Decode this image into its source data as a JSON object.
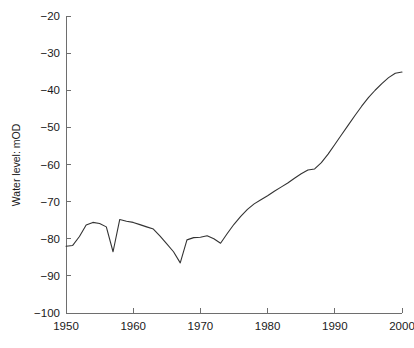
{
  "chart_data": {
    "type": "line",
    "title": "",
    "subtitle": "",
    "xlabel": "",
    "ylabel": "Water level: mOD",
    "xlim": [
      1950,
      2000
    ],
    "ylim": [
      -100,
      -20
    ],
    "grid": false,
    "legend": null,
    "legend_position": "none",
    "x_ticks": [
      1950,
      1960,
      1970,
      1980,
      1990,
      2000
    ],
    "x_tick_labels": [
      "1950",
      "1960",
      "1970",
      "1980",
      "1990",
      "2000"
    ],
    "y_ticks": [
      -100,
      -90,
      -80,
      -70,
      -60,
      -50,
      -40,
      -30,
      -20
    ],
    "y_tick_labels": [
      "−100",
      "−90",
      "−80",
      "−70",
      "−60",
      "−50",
      "−40",
      "−30",
      "−20"
    ],
    "series": [
      {
        "name": "Water level",
        "color": "#333333",
        "x": [
          1950,
          1951,
          1952,
          1953,
          1954,
          1955,
          1956,
          1957,
          1958,
          1959,
          1960,
          1961,
          1962,
          1963,
          1964,
          1965,
          1966,
          1967,
          1968,
          1969,
          1970,
          1971,
          1972,
          1973,
          1974,
          1975,
          1976,
          1977,
          1978,
          1979,
          1980,
          1981,
          1982,
          1983,
          1984,
          1985,
          1986,
          1987,
          1988,
          1989,
          1990,
          1991,
          1992,
          1993,
          1994,
          1995,
          1996,
          1997,
          1998,
          1999,
          2000
        ],
        "values": [
          -82.0,
          -81.8,
          -79.4,
          -76.3,
          -75.6,
          -75.9,
          -76.8,
          -83.5,
          -74.8,
          -75.3,
          -75.6,
          -76.2,
          -76.8,
          -77.4,
          -79.3,
          -81.4,
          -83.5,
          -86.5,
          -80.3,
          -79.7,
          -79.6,
          -79.2,
          -80.0,
          -81.2,
          -78.6,
          -76.1,
          -74.0,
          -72.1,
          -70.6,
          -69.5,
          -68.4,
          -67.2,
          -66.1,
          -65.0,
          -63.7,
          -62.5,
          -61.5,
          -61.2,
          -59.5,
          -57.2,
          -54.6,
          -52.0,
          -49.4,
          -46.8,
          -44.3,
          -42.0,
          -40.0,
          -38.2,
          -36.6,
          -35.4,
          -35.1
        ]
      }
    ]
  },
  "axes": {
    "y_axis_title": "Water level: mOD"
  }
}
